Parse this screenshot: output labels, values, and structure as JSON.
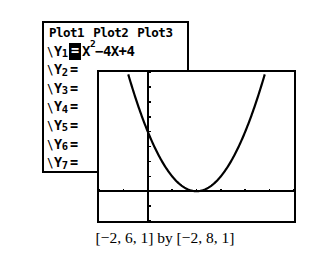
{
  "figure": {
    "device": "graphing-calculator",
    "caption": "[−2, 6, 1] by [−2, 8, 1]"
  },
  "yeditor": {
    "plot_tabs": [
      {
        "label": "Plot1",
        "selected": false
      },
      {
        "label": "Plot2",
        "selected": false
      },
      {
        "label": "Plot3",
        "selected": false
      }
    ],
    "rows": [
      {
        "prefix": "\\",
        "name": "Y",
        "index": "1",
        "equals": "=",
        "selected": true,
        "expr_base": "X",
        "expr_sup": "2",
        "expr_rest": "−4X+4"
      },
      {
        "prefix": "\\",
        "name": "Y",
        "index": "2",
        "equals": "=",
        "selected": false,
        "expr_base": "",
        "expr_sup": "",
        "expr_rest": ""
      },
      {
        "prefix": "\\",
        "name": "Y",
        "index": "3",
        "equals": "=",
        "selected": false,
        "expr_base": "",
        "expr_sup": "",
        "expr_rest": ""
      },
      {
        "prefix": "\\",
        "name": "Y",
        "index": "4",
        "equals": "=",
        "selected": false,
        "expr_base": "",
        "expr_sup": "",
        "expr_rest": ""
      },
      {
        "prefix": "\\",
        "name": "Y",
        "index": "5",
        "equals": "=",
        "selected": false,
        "expr_base": "",
        "expr_sup": "",
        "expr_rest": ""
      },
      {
        "prefix": "\\",
        "name": "Y",
        "index": "6",
        "equals": "=",
        "selected": false,
        "expr_base": "",
        "expr_sup": "",
        "expr_rest": ""
      },
      {
        "prefix": "\\",
        "name": "Y",
        "index": "7",
        "equals": "=",
        "selected": false,
        "expr_base": "",
        "expr_sup": "",
        "expr_rest": ""
      }
    ]
  },
  "chart_data": {
    "type": "line",
    "title": "",
    "xlabel": "",
    "ylabel": "",
    "equation": "Y1 = X² - 4X + 4",
    "xlim": [
      -2,
      6
    ],
    "ylim": [
      -2,
      8
    ],
    "xscl": 1,
    "yscl": 1,
    "grid": false,
    "legend": "none",
    "axes_visible": true,
    "vertex": [
      2,
      0
    ],
    "roots": [
      2
    ],
    "y_intercept": 4,
    "series": [
      {
        "name": "Y1 = X² - 4X + 4",
        "x": [
          -0.83,
          -0.7,
          -0.6,
          -0.5,
          -0.4,
          -0.3,
          -0.2,
          -0.1,
          0,
          0.2,
          0.4,
          0.6,
          0.8,
          1.0,
          1.2,
          1.4,
          1.6,
          1.8,
          2.0,
          2.2,
          2.4,
          2.6,
          2.8,
          3.0,
          3.2,
          3.4,
          3.6,
          3.8,
          4.0,
          4.2,
          4.4,
          4.6,
          4.8,
          4.83
        ],
        "y": [
          8.0,
          7.29,
          6.76,
          6.25,
          5.76,
          5.29,
          4.84,
          4.41,
          4.0,
          3.24,
          2.56,
          1.96,
          1.44,
          1.0,
          0.64,
          0.36,
          0.16,
          0.04,
          0.0,
          0.04,
          0.16,
          0.36,
          0.64,
          1.0,
          1.44,
          1.96,
          2.56,
          3.24,
          4.0,
          4.84,
          5.76,
          6.76,
          7.84,
          8.0
        ]
      }
    ],
    "x_ticks": [
      -2,
      -1,
      0,
      1,
      2,
      3,
      4,
      5,
      6
    ],
    "y_ticks": [
      -2,
      -1,
      0,
      1,
      2,
      3,
      4,
      5,
      6,
      7,
      8
    ]
  }
}
